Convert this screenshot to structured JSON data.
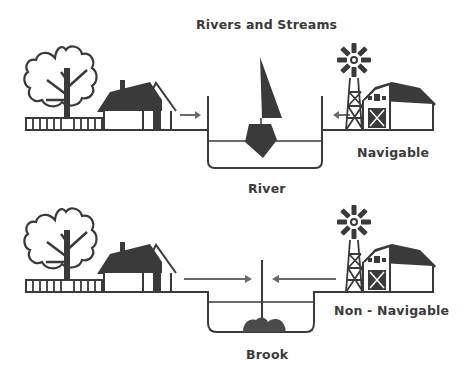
{
  "title": "Rivers and Streams",
  "panels": [
    {
      "id": "top",
      "channel_label": "River",
      "type_label": "Navigable",
      "vessel": "sailboat",
      "elements": [
        "tree",
        "fence",
        "house",
        "arrow-right",
        "channel",
        "sailboat",
        "arrow-left",
        "windmill",
        "barn"
      ]
    },
    {
      "id": "bottom",
      "channel_label": "Brook",
      "type_label": "Non - Navigable",
      "vessel": "stick-and-rocks",
      "elements": [
        "tree",
        "fence",
        "house",
        "arrow-right",
        "channel",
        "stick",
        "rocks",
        "arrow-left",
        "windmill",
        "barn"
      ]
    }
  ],
  "colors": {
    "line": "#3a3a3a",
    "fill": "#3a3a3a",
    "arrow": "#6a6a6a",
    "background": "#ffffff"
  }
}
